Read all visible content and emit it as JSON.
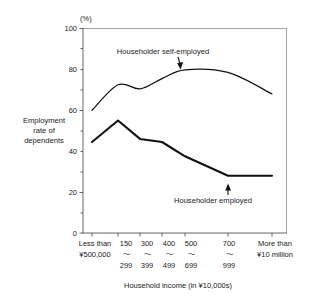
{
  "chart_data": {
    "type": "line",
    "title": "",
    "xlabel": "Household income (in ¥10,000s)",
    "ylabel": "Employment rate of dependents",
    "yunit": "(%)",
    "ylim": [
      0,
      100
    ],
    "yticks": [
      0,
      20,
      40,
      60,
      80,
      100
    ],
    "grid": false,
    "legend_position": "inline-annotations",
    "categories": [
      "Less than ¥500,000",
      "150 ～ 299",
      "300 ～ 399",
      "400 ～ 499",
      "500 ～ 699",
      "700 ～ 999",
      "More than ¥10 million"
    ],
    "xtick_top": [
      "Less than",
      "150",
      "300",
      "400",
      "500",
      "700",
      "More than"
    ],
    "xtick_mid": [
      "¥500,000",
      "～",
      "～",
      "～",
      "～",
      "～",
      "¥10 million"
    ],
    "xtick_bottom": [
      "",
      "299",
      "399",
      "499",
      "699",
      "999",
      ""
    ],
    "series": [
      {
        "name": "Householder self-employed",
        "values": [
          60.0,
          72.5,
          70.5,
          75.5,
          79.8,
          78.5,
          68.0
        ]
      },
      {
        "name": "Householder employed",
        "values": [
          44.5,
          55.0,
          46.0,
          44.5,
          37.5,
          28.0,
          28.0
        ]
      }
    ],
    "annotations": [
      {
        "text": "Householder self-employed",
        "series": "Householder self-employed"
      },
      {
        "text": "Householder employed",
        "series": "Householder employed"
      }
    ],
    "colors": {
      "line": "#111111",
      "axis": "#555555",
      "frame": "#8c8c8c",
      "background": "#ffffff"
    }
  }
}
